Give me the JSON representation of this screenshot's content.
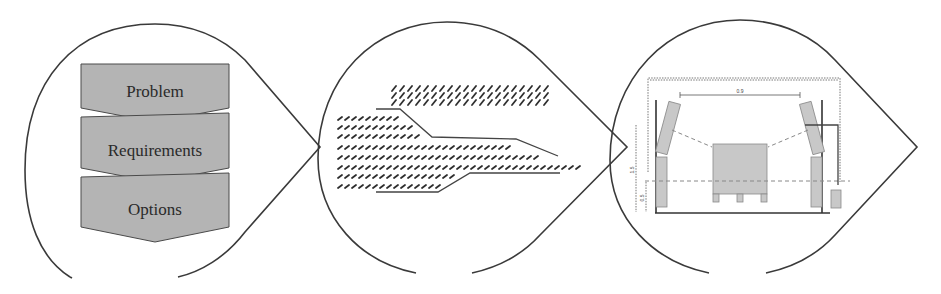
{
  "panels": [
    {
      "id": "analysis",
      "shape": "teardrop-pointing-right",
      "steps": [
        {
          "label": "Problem"
        },
        {
          "label": "Requirements"
        },
        {
          "label": "Options"
        }
      ],
      "step_fill": "#b4b4b4"
    },
    {
      "id": "concept-sketch",
      "shape": "teardrop-pointing-right",
      "description": "Hatched schematic of a stepped tapered arrow/channel with a hatched bar above"
    },
    {
      "id": "technical-drawing",
      "shape": "teardrop-pointing-right",
      "description": "Front-view technical layout: gantry frame with two tilted side units, a central pallet load, dimension lines",
      "dimension_labels": [
        "0.9",
        "1.5",
        "0.5"
      ],
      "part_labels": [
        "A1",
        "A2",
        "B1",
        "B2",
        "C"
      ]
    }
  ],
  "colors": {
    "outline": "#3a3a3a",
    "step_fill": "#b4b4b4",
    "hatch": "#2e2e2e",
    "part_fill": "#c8c8c8"
  }
}
